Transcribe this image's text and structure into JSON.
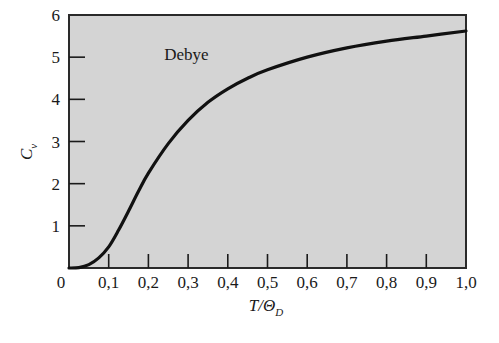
{
  "chart_data": {
    "type": "line",
    "title": "",
    "xlabel": "T/Θ_D",
    "xlabel_main": "T/Θ",
    "xlabel_sub": "D",
    "ylabel": "C_v",
    "ylabel_main": "C",
    "ylabel_sub": "v",
    "xlim": [
      0,
      1.0
    ],
    "ylim": [
      0,
      6
    ],
    "grid": false,
    "legend": null,
    "x_ticks": [
      "0",
      "0,1",
      "0,2",
      "0,3",
      "0,4",
      "0,5",
      "0,6",
      "0,7",
      "0,8",
      "0,9",
      "1,0"
    ],
    "y_ticks": [
      "1",
      "2",
      "3",
      "4",
      "5",
      "6"
    ],
    "annotations": [
      {
        "text": "Debye",
        "x": 0.29,
        "y": 5.0
      }
    ],
    "series": [
      {
        "name": "Debye",
        "x": [
          0,
          0.025,
          0.05,
          0.075,
          0.1,
          0.125,
          0.15,
          0.175,
          0.2,
          0.25,
          0.3,
          0.35,
          0.4,
          0.45,
          0.5,
          0.6,
          0.7,
          0.8,
          0.9,
          1.0
        ],
        "values": [
          0,
          0.01,
          0.08,
          0.24,
          0.5,
          0.9,
          1.35,
          1.82,
          2.25,
          2.95,
          3.5,
          3.93,
          4.25,
          4.5,
          4.7,
          5.0,
          5.22,
          5.38,
          5.5,
          5.62
        ]
      }
    ],
    "colors": {
      "plot_bg": "#d4d4d4",
      "line": "#111111",
      "frame": "#2a2a2a"
    }
  }
}
